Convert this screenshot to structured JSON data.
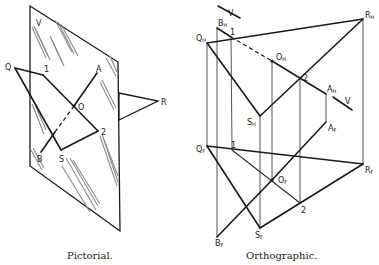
{
  "pictorial": {
    "caption": "Pictorial.",
    "labels": {
      "plane": "V",
      "q": "Q",
      "one": "1",
      "a": "A",
      "o": "O",
      "r": "R",
      "two": "2",
      "b": "B",
      "s": "S"
    }
  },
  "orthographic": {
    "caption": "Orthographic.",
    "labels": {
      "v_top": "V",
      "v_right": "V",
      "bh": {
        "main": "B",
        "sub": "H"
      },
      "one_h": "1",
      "qh": {
        "main": "Q",
        "sub": "H"
      },
      "rh": {
        "main": "R",
        "sub": "H"
      },
      "oh": {
        "main": "O",
        "sub": "H"
      },
      "two_h": "2",
      "ah": {
        "main": "A",
        "sub": "H"
      },
      "sh": {
        "main": "S",
        "sub": "H"
      },
      "af": {
        "main": "A",
        "sub": "F"
      },
      "qf": {
        "main": "Q",
        "sub": "F"
      },
      "one_f": "1",
      "rf": {
        "main": "R",
        "sub": "F"
      },
      "of": {
        "main": "O",
        "sub": "F"
      },
      "two_f": "2",
      "bf": {
        "main": "B",
        "sub": "F"
      },
      "sf": {
        "main": "S",
        "sub": "F"
      }
    }
  }
}
